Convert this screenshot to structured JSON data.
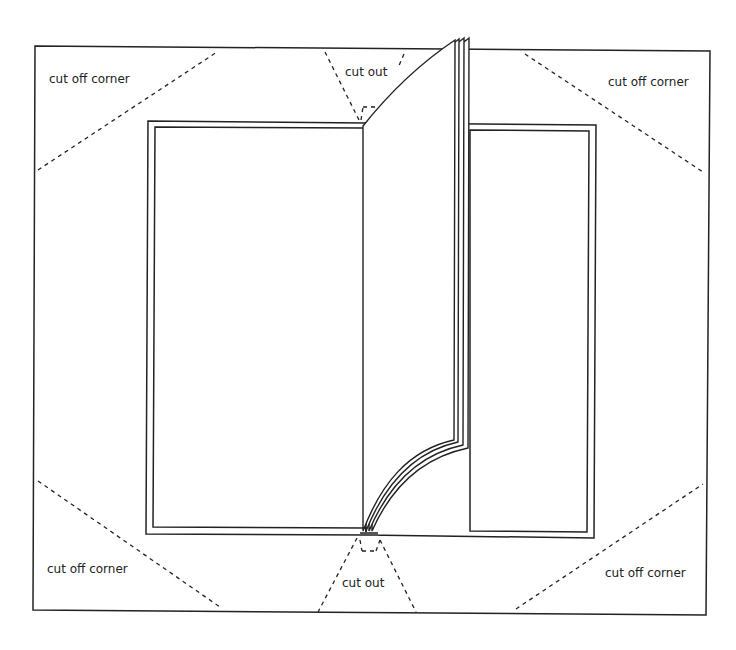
{
  "diagram": {
    "labels": {
      "top_left": "cut off corner",
      "top_right": "cut off corner",
      "bottom_left": "cut off corner",
      "bottom_right": "cut off corner",
      "top_center": "cut out",
      "bottom_center": "cut out"
    },
    "colors": {
      "line": "#222222",
      "background": "#ffffff"
    },
    "elements": {
      "outer_sheet": "cover paper sheet",
      "left_board": "left cover board (double outline)",
      "right_board": "right cover board (double outline)",
      "pages": "stack of 4 pages turning at spine"
    }
  }
}
